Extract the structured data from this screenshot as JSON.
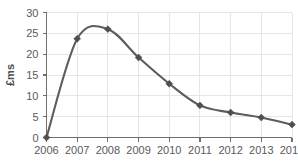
{
  "chart_data": {
    "type": "line",
    "title": "",
    "subtitle": "",
    "xlabel": "",
    "ylabel": "£ms",
    "categories": [
      "2006",
      "2007",
      "2008",
      "2009",
      "2010",
      "2011",
      "2012",
      "2013",
      "2014"
    ],
    "x": [
      2006,
      2007,
      2008,
      2009,
      2010,
      2011,
      2012,
      2013,
      2014
    ],
    "values": [
      0,
      23.7,
      26.0,
      19.2,
      12.9,
      7.7,
      6.0,
      4.8,
      3.1
    ],
    "series": [
      {
        "name": "",
        "values": [
          0,
          23.7,
          26.0,
          19.2,
          12.9,
          7.7,
          6.0,
          4.8,
          3.1
        ]
      }
    ],
    "ylim": [
      0,
      30
    ],
    "yticks": [
      0,
      5,
      10,
      15,
      20,
      25,
      30
    ],
    "ytick_labels": [
      "0",
      "5",
      "10",
      "15",
      "20",
      "25",
      "30"
    ],
    "xtick_labels": [
      "2006",
      "2007",
      "2008",
      "2009",
      "2010",
      "2011",
      "2012",
      "2013",
      "2014"
    ],
    "grid": true,
    "grid_axis": "both",
    "legend": false,
    "legend_position": "none",
    "marker": "diamond",
    "line_color": "#5d5d5d",
    "marker_color": "#4f4f4f",
    "grid_color": "#e6e6e6",
    "axis_color": "#6e6e6e",
    "tick_label_color": "#5a5a5a",
    "background_color": "#ffffff",
    "annotations": []
  }
}
